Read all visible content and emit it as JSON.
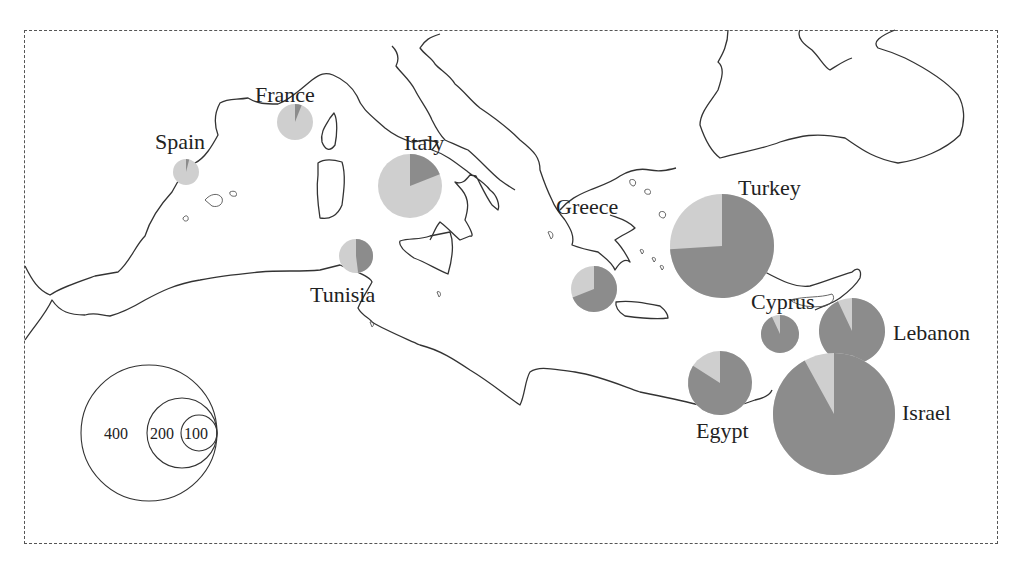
{
  "title": "",
  "colors": {
    "series_dark": "#8c8c8c",
    "series_light": "#cfcfcf",
    "coast": "#333333"
  },
  "countries": [
    {
      "name": "Spain",
      "label": "Spain",
      "cx": 186,
      "cy": 172,
      "r": 13,
      "total": 75,
      "dark_share": 0.04,
      "label_x": 155,
      "label_y": 131
    },
    {
      "name": "France",
      "label": "France",
      "cx": 295,
      "cy": 122,
      "r": 18,
      "total": 100,
      "dark_share": 0.06,
      "label_x": 255,
      "label_y": 84
    },
    {
      "name": "Italy",
      "label": "Italy",
      "cx": 410,
      "cy": 186,
      "r": 32,
      "total": 185,
      "dark_share": 0.19,
      "label_x": 404,
      "label_y": 132
    },
    {
      "name": "Tunisia",
      "label": "Tunisia",
      "cx": 356,
      "cy": 256,
      "r": 17,
      "total": 100,
      "dark_share": 0.48,
      "label_x": 310,
      "label_y": 284
    },
    {
      "name": "Greece",
      "label": "Greece",
      "cx": 594,
      "cy": 289,
      "r": 23,
      "total": 135,
      "dark_share": 0.69,
      "label_x": 556,
      "label_y": 196
    },
    {
      "name": "Turkey",
      "label": "Turkey",
      "cx": 722,
      "cy": 246,
      "r": 52,
      "total": 305,
      "dark_share": 0.74,
      "label_x": 738,
      "label_y": 177
    },
    {
      "name": "Cyprus",
      "label": "Cyprus",
      "cx": 780,
      "cy": 334,
      "r": 19,
      "total": 110,
      "dark_share": 0.93,
      "label_x": 751,
      "label_y": 291
    },
    {
      "name": "Lebanon",
      "label": "Lebanon",
      "cx": 852,
      "cy": 331,
      "r": 33,
      "total": 190,
      "dark_share": 0.93,
      "label_x": 893,
      "label_y": 322
    },
    {
      "name": "Egypt",
      "label": "Egypt",
      "cx": 720,
      "cy": 383,
      "r": 32,
      "total": 185,
      "dark_share": 0.84,
      "label_x": 696,
      "label_y": 420
    },
    {
      "name": "Israel",
      "label": "Israel",
      "cx": 834,
      "cy": 414,
      "r": 61,
      "total": 355,
      "dark_share": 0.92,
      "label_x": 902,
      "label_y": 402
    }
  ],
  "legend": {
    "circles": [
      {
        "value": "400",
        "label": "400",
        "r": 68
      },
      {
        "value": "200",
        "label": "200",
        "r": 35
      },
      {
        "value": "100",
        "label": "100",
        "r": 18
      }
    ],
    "anchor_x": 217,
    "anchor_y": 433
  },
  "chart_data": {
    "type": "pie",
    "title": "",
    "categories": [
      "Spain",
      "France",
      "Italy",
      "Tunisia",
      "Greece",
      "Turkey",
      "Cyprus",
      "Lebanon",
      "Egypt",
      "Israel"
    ],
    "totals": [
      75,
      100,
      185,
      100,
      135,
      305,
      110,
      190,
      185,
      355
    ],
    "series": [
      {
        "name": "dark",
        "values": [
          0.04,
          0.06,
          0.19,
          0.48,
          0.69,
          0.74,
          0.93,
          0.93,
          0.84,
          0.92
        ]
      },
      {
        "name": "light",
        "values": [
          0.96,
          0.94,
          0.81,
          0.52,
          0.31,
          0.26,
          0.07,
          0.07,
          0.16,
          0.08
        ]
      }
    ],
    "legend": {
      "title": "",
      "size_values": [
        400,
        200,
        100
      ],
      "position": "lower-left"
    }
  }
}
